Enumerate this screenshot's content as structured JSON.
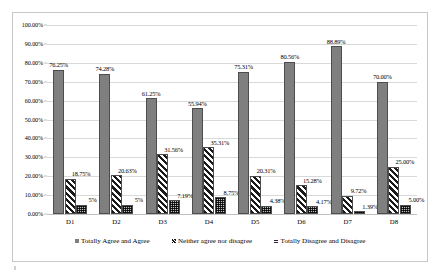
{
  "chart_data": {
    "type": "bar",
    "title": "",
    "xlabel": "",
    "ylabel": "",
    "ylim": [
      0,
      100
    ],
    "grid": true,
    "legend_position": "bottom",
    "categories": [
      "D1",
      "D2",
      "D3",
      "D4",
      "D5",
      "D6",
      "D7",
      "D8"
    ],
    "ytick_labels": [
      "0.00%",
      "10.00%",
      "20.00%",
      "30.00%",
      "40.00%",
      "50.00%",
      "60.00%",
      "70.00%",
      "80.00%",
      "90.00%",
      "100.00%"
    ],
    "ytick_values": [
      0,
      10,
      20,
      30,
      40,
      50,
      60,
      70,
      80,
      90,
      100
    ],
    "series": [
      {
        "name": "Totally Agree and Agree",
        "pattern": "solid",
        "color": "#7f7f7f",
        "values": [
          76.25,
          74.28,
          61.25,
          55.94,
          75.31,
          80.56,
          88.89,
          70.0
        ],
        "labels": [
          "76.25%",
          "74.28%",
          "61.25%",
          "55.94%",
          "75.31%",
          "80.56%",
          "88.89%",
          "70.00%"
        ]
      },
      {
        "name": "Neither agree nor disagree",
        "pattern": "diagonal-hatch",
        "color": "#1a1a1a",
        "values": [
          18.75,
          20.63,
          31.56,
          35.31,
          20.31,
          15.28,
          9.72,
          25.0
        ],
        "labels": [
          "18.75%",
          "20.63%",
          "31.56%",
          "35.31%",
          "20.31%",
          "15.28%",
          "9.72%",
          "25.00%"
        ]
      },
      {
        "name": "Totally Disagree and Disagree",
        "pattern": "dotted-grid",
        "color": "#262626",
        "values": [
          5.0,
          5.0,
          7.19,
          8.75,
          4.38,
          4.17,
          1.39,
          5.0
        ],
        "labels": [
          "5%",
          "5%",
          "7.19%",
          "8.75%",
          "4.38%",
          "4.17%",
          "1.39%",
          "5.00%"
        ]
      }
    ]
  }
}
